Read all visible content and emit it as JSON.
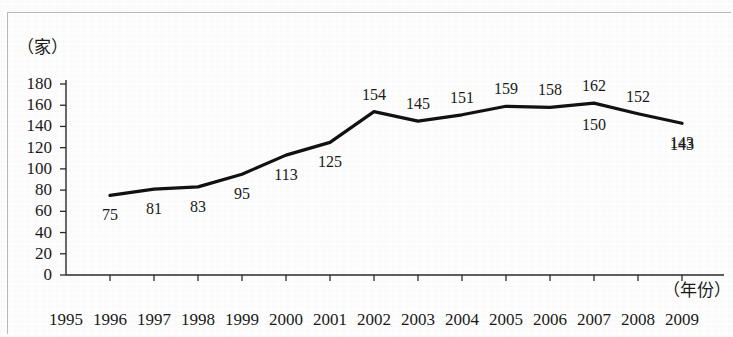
{
  "frame": {
    "border_color": "#b9b9b9",
    "background": "#fdfdfd"
  },
  "axes": {
    "y_unit_label": "（家）",
    "x_unit_label": "（年份）",
    "y_ticks": [
      "180",
      "160",
      "140",
      "120",
      "100",
      "80",
      "60",
      "40",
      "20",
      "0"
    ],
    "x_ticks": [
      "1995",
      "1996",
      "1997",
      "1998",
      "1999",
      "2000",
      "2001",
      "2002",
      "2003",
      "2004",
      "2005",
      "2006",
      "2007",
      "2008",
      "2009"
    ]
  },
  "chart_data": {
    "type": "line",
    "title": "",
    "subtitle": "",
    "xlabel": "（年份）",
    "ylabel": "（家）",
    "ylim": [
      0,
      180
    ],
    "ytick_step": 20,
    "grid": false,
    "legend": null,
    "line_color": "#111111",
    "line_width": 3,
    "x": [
      "1995",
      "1996",
      "1997",
      "1998",
      "1999",
      "2000",
      "2001",
      "2002",
      "2003",
      "2004",
      "2005",
      "2006",
      "2007",
      "2008",
      "2009"
    ],
    "categories": [
      "1996",
      "1997",
      "1998",
      "1999",
      "2000",
      "2001",
      "2002",
      "2003",
      "2004",
      "2005",
      "2006",
      "2007",
      "2008",
      "2009"
    ],
    "values": [
      75,
      81,
      83,
      95,
      113,
      125,
      154,
      145,
      151,
      159,
      158,
      162,
      152,
      143
    ],
    "series": [
      {
        "name": "",
        "points": [
          {
            "x": "1996",
            "y": 75,
            "label": "75",
            "label_pos": "below"
          },
          {
            "x": "1997",
            "y": 81,
            "label": "81",
            "label_pos": "below"
          },
          {
            "x": "1998",
            "y": 83,
            "label": "83",
            "label_pos": "below"
          },
          {
            "x": "1999",
            "y": 95,
            "label": "95",
            "label_pos": "below"
          },
          {
            "x": "2000",
            "y": 113,
            "label": "113",
            "label_pos": "below"
          },
          {
            "x": "2001",
            "y": 125,
            "label": "125",
            "label_pos": "below"
          },
          {
            "x": "2002",
            "y": 154,
            "label": "154",
            "label_pos": "above"
          },
          {
            "x": "2003",
            "y": 145,
            "label": "145",
            "label_pos": "above"
          },
          {
            "x": "2004",
            "y": 151,
            "label": "151",
            "label_pos": "above"
          },
          {
            "x": "2005",
            "y": 159,
            "label": "159",
            "label_pos": "above"
          },
          {
            "x": "2006",
            "y": 158,
            "label": "158",
            "label_pos": "above"
          },
          {
            "x": "2007",
            "y": 162,
            "label": "162",
            "label_pos": "above"
          },
          {
            "x": "2008",
            "y": 152,
            "label": "152",
            "label_pos": "above"
          },
          {
            "x": "2009",
            "y": 143,
            "label": "143",
            "label_pos": "below"
          }
        ]
      }
    ],
    "extra_labels": [
      {
        "text": "150",
        "near": "2007",
        "label_pos": "below"
      },
      {
        "text": "143",
        "near": "2009",
        "label_pos": "below"
      }
    ]
  },
  "geometry": {
    "plot_left": 66,
    "plot_right": 724,
    "y_top_px": 84,
    "y_zero_px": 275,
    "x_step": 44,
    "first_year_x": 66
  }
}
